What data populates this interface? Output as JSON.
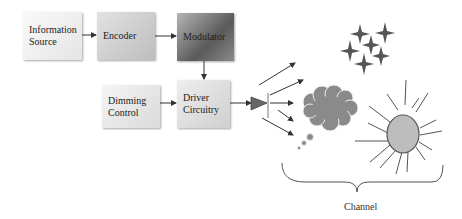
{
  "diagram": {
    "blocks": [
      {
        "id": "info",
        "lines": [
          "Information",
          "Source"
        ]
      },
      {
        "id": "enc",
        "lines": [
          "Encoder"
        ]
      },
      {
        "id": "mod",
        "lines": [
          "Modulator"
        ]
      },
      {
        "id": "dim",
        "lines": [
          "Dimming",
          "Control"
        ]
      },
      {
        "id": "drv",
        "lines": [
          "Driver",
          "Circuitry"
        ]
      }
    ],
    "channel_label": "Channel",
    "icons": [
      "led-icon",
      "stars-icon",
      "cloud-icon",
      "sun-icon",
      "brace-icon"
    ],
    "colors": {
      "arrow": "#333333",
      "led": "#666666",
      "cloud": "#8a8a8a",
      "sun": "#bdbdbd"
    }
  }
}
